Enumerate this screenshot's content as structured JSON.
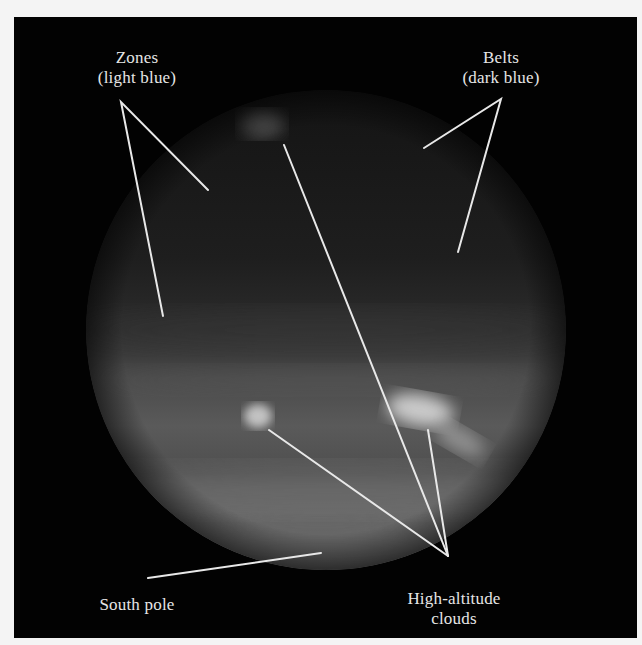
{
  "figure": {
    "colors": {
      "background": "#020202",
      "frame_border": "#f4f4f4",
      "label_text": "#e6e6e6",
      "leader_line": "#e8e8e8",
      "planet_dark": "#1c1c1c",
      "planet_mid": "#555555",
      "cloud_bright": "#d8d8d8"
    },
    "labels": {
      "zones": {
        "line1": "Zones",
        "line2": "(light blue)"
      },
      "belts": {
        "line1": "Belts",
        "line2": "(dark blue)"
      },
      "clouds": {
        "line1": "High-altitude",
        "line2": "clouds"
      },
      "south_pole": {
        "line1": "South pole"
      }
    }
  }
}
